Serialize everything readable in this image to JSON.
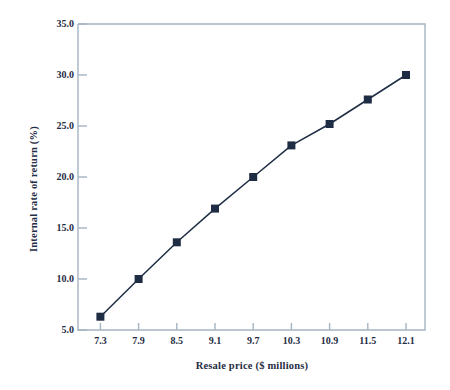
{
  "chart_data": {
    "type": "line",
    "title": "",
    "xlabel": "Resale price ($ millions)",
    "ylabel": "Internal rate of return (%)",
    "categories": [
      "7.3",
      "7.9",
      "8.5",
      "9.1",
      "9.7",
      "10.3",
      "10.9",
      "11.5",
      "12.1"
    ],
    "x": [
      7.3,
      7.9,
      8.5,
      9.1,
      9.7,
      10.3,
      10.9,
      11.5,
      12.1
    ],
    "values": [
      6.3,
      10.0,
      13.6,
      16.9,
      20.0,
      23.1,
      25.2,
      27.6,
      30.0
    ],
    "series": [
      {
        "name": "Internal rate of return",
        "values": [
          6.3,
          10.0,
          13.6,
          16.9,
          20.0,
          23.1,
          25.2,
          27.6,
          30.0
        ]
      }
    ],
    "ylim": [
      5.0,
      35.0
    ],
    "yticks": [
      5.0,
      10.0,
      15.0,
      20.0,
      25.0,
      30.0,
      35.0
    ],
    "ytick_labels": [
      "5.0",
      "10.0",
      "15.0",
      "20.0",
      "25.0",
      "30.0",
      "35.0"
    ],
    "xtick_labels": [
      "7.3",
      "7.9",
      "8.5",
      "9.1",
      "9.7",
      "10.3",
      "10.9",
      "11.5",
      "12.1"
    ],
    "grid": false,
    "legend": false,
    "legend_position": "none",
    "marker": "square",
    "colors": {
      "line": "#1f2d44",
      "marker": "#1f2d44",
      "axis": "#a5b4c2",
      "text": "#1f2d44",
      "background": "#ffffff"
    }
  }
}
